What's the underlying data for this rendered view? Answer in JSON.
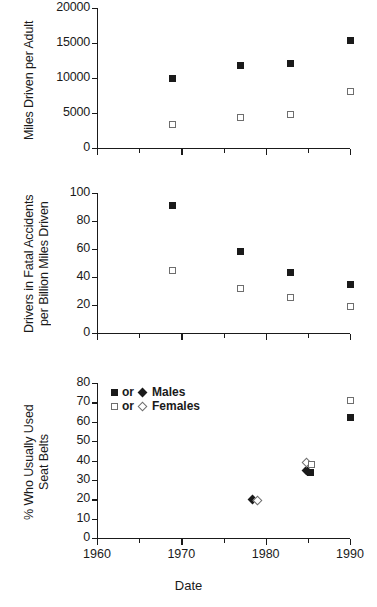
{
  "figure": {
    "xlabel": "Date",
    "xticks": [
      1960,
      1970,
      1980,
      1990
    ],
    "xlim": [
      1960,
      1990
    ],
    "xminor_step": 5
  },
  "legend": {
    "position": "bottom-panel-top-left",
    "entries": [
      {
        "filled_symbol": "filled-square",
        "or_text": "or",
        "second_symbol": "filled-diamond",
        "label": "Males"
      },
      {
        "filled_symbol": "open-square",
        "or_text": "or",
        "second_symbol": "open-diamond",
        "label": "Females"
      }
    ]
  },
  "chart_data": [
    {
      "type": "scatter",
      "title": "",
      "xlabel": "",
      "ylabel": "Miles Driven per Adult",
      "xlim": [
        1960,
        1990
      ],
      "ylim": [
        0,
        20000
      ],
      "yticks": [
        0,
        5000,
        10000,
        15000,
        20000
      ],
      "grid": false,
      "series": [
        {
          "name": "Males",
          "marker": "filled-square",
          "x": [
            1969,
            1977,
            1983,
            1990
          ],
          "y": [
            9900,
            11800,
            12100,
            15300
          ]
        },
        {
          "name": "Females",
          "marker": "open-square",
          "x": [
            1969,
            1977,
            1983,
            1990
          ],
          "y": [
            3300,
            4400,
            4850,
            8100
          ]
        }
      ]
    },
    {
      "type": "scatter",
      "title": "",
      "xlabel": "",
      "ylabel": "Drivers in Fatal Accidents\nper Billion Miles Driven",
      "xlim": [
        1960,
        1990
      ],
      "ylim": [
        0,
        100
      ],
      "yticks": [
        0,
        20,
        40,
        60,
        80,
        100
      ],
      "grid": false,
      "series": [
        {
          "name": "Males",
          "marker": "filled-square",
          "x": [
            1969,
            1977,
            1983,
            1990
          ],
          "y": [
            91,
            58,
            43.5,
            35
          ]
        },
        {
          "name": "Females",
          "marker": "open-square",
          "x": [
            1969,
            1977,
            1983,
            1990
          ],
          "y": [
            44.5,
            32,
            25.5,
            19
          ]
        }
      ]
    },
    {
      "type": "scatter",
      "title": "",
      "xlabel": "Date",
      "ylabel": "% Who Usually Used\nSeat Belts",
      "xlim": [
        1960,
        1990
      ],
      "ylim": [
        0,
        80
      ],
      "yticks": [
        0,
        10,
        20,
        30,
        40,
        50,
        60,
        70,
        80
      ],
      "grid": false,
      "series": [
        {
          "name": "Males",
          "marker": "filled-diamond",
          "x": [
            1978.4
          ],
          "y": [
            20
          ]
        },
        {
          "name": "Females",
          "marker": "open-diamond",
          "x": [
            1979.0
          ],
          "y": [
            19.5
          ]
        },
        {
          "name": "Males",
          "marker": "filled-diamond",
          "x": [
            1984.8
          ],
          "y": [
            35
          ]
        },
        {
          "name": "Females",
          "marker": "open-diamond",
          "x": [
            1984.9
          ],
          "y": [
            39
          ]
        },
        {
          "name": "Males",
          "marker": "filled-square",
          "x": [
            1985.3
          ],
          "y": [
            34
          ]
        },
        {
          "name": "Females",
          "marker": "open-square",
          "x": [
            1985.4
          ],
          "y": [
            38
          ]
        },
        {
          "name": "Females",
          "marker": "open-square",
          "x": [
            1990
          ],
          "y": [
            71
          ]
        },
        {
          "name": "Males",
          "marker": "filled-square",
          "x": [
            1990
          ],
          "y": [
            62
          ]
        }
      ]
    }
  ]
}
